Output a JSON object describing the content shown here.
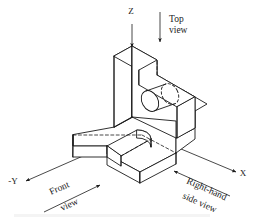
{
  "figure": {
    "kind": "isometric-technical-drawing",
    "background_color": "#ffffff",
    "line_color": "#1a1a1a",
    "visible_line_width": 1,
    "hidden_line_style": "dashed"
  },
  "axes": [
    {
      "id": "z",
      "label": "Z",
      "direction": "up",
      "arrow": "up",
      "label_x": 131,
      "label_y": 14
    },
    {
      "id": "x",
      "label": "X",
      "direction": "lower-right-isometric",
      "arrow": "up-right",
      "label_x": 243,
      "label_y": 176
    },
    {
      "id": "minus_y",
      "label": "-Y",
      "direction": "lower-left-isometric",
      "arrow": "down-left",
      "label_x": 13,
      "label_y": 184
    }
  ],
  "view_labels": [
    {
      "id": "top-view",
      "line1": "Top",
      "line2": "view",
      "arrow": "down",
      "rotation_deg": 0,
      "text_x": 172,
      "text_y": 25
    },
    {
      "id": "front-view",
      "line1": "Front",
      "line2": "view",
      "arrow": "up-right",
      "rotation_deg": -24,
      "text_x": 52,
      "text_y": 191
    },
    {
      "id": "right-hand-side-view",
      "line1": "Right-hand",
      "line2": "side view",
      "arrow": "up-left",
      "rotation_deg": 24,
      "text_x": 192,
      "text_y": 183
    }
  ],
  "part_features": [
    "rectangular base plate",
    "front-left arm with rounded-end U slot",
    "vertical back plate with angled chamfer",
    "through cylindrical hole in the inclined face"
  ]
}
